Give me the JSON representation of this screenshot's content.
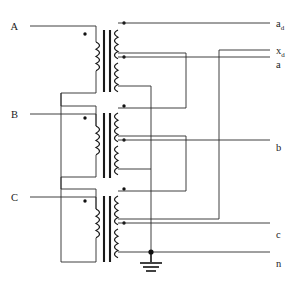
{
  "diagram": {
    "type": "electrical-schematic",
    "primary_connection": "delta",
    "secondary_connection": "zigzag-with-extended-delta-tap",
    "phase_count": 3,
    "core_limb_count": 3,
    "primary_winding_count": 3,
    "secondary_winding_count": 6
  },
  "terminals": {
    "primary": [
      {
        "id": "A",
        "label": "A",
        "x": 20,
        "y": 26
      },
      {
        "id": "B",
        "label": "B",
        "x": 20,
        "y": 114
      },
      {
        "id": "C",
        "label": "C",
        "x": 20,
        "y": 197
      }
    ],
    "secondary": [
      {
        "id": "ad",
        "label": "a",
        "sub": "d",
        "x": 276,
        "y": 24
      },
      {
        "id": "xd",
        "label": "x",
        "sub": "d",
        "x": 276,
        "y": 52
      },
      {
        "id": "a",
        "label": "a",
        "sub": "",
        "x": 276,
        "y": 65
      },
      {
        "id": "b",
        "label": "b",
        "sub": "",
        "x": 276,
        "y": 148
      },
      {
        "id": "c",
        "label": "c",
        "sub": "",
        "x": 276,
        "y": 235
      },
      {
        "id": "n",
        "label": "n",
        "sub": "",
        "x": 276,
        "y": 264
      }
    ]
  },
  "windings": {
    "primary": [
      {
        "id": "P-A",
        "phase": "A",
        "polarity_dot": true
      },
      {
        "id": "P-B",
        "phase": "B",
        "polarity_dot": true
      },
      {
        "id": "P-C",
        "phase": "C",
        "polarity_dot": true
      }
    ],
    "secondary": [
      {
        "id": "S1",
        "limb": 1,
        "position": "upper",
        "polarity_dot": true
      },
      {
        "id": "S2",
        "limb": 1,
        "position": "lower",
        "polarity_dot": true
      },
      {
        "id": "S3",
        "limb": 2,
        "position": "upper",
        "polarity_dot": true
      },
      {
        "id": "S4",
        "limb": 2,
        "position": "lower",
        "polarity_dot": true
      },
      {
        "id": "S5",
        "limb": 3,
        "position": "upper",
        "polarity_dot": true
      },
      {
        "id": "S6",
        "limb": 3,
        "position": "lower",
        "polarity_dot": true
      }
    ]
  },
  "ground": {
    "present": true,
    "symbol": "earth-ground",
    "x": 151,
    "y": 265,
    "junction_dot": true
  },
  "colors": {
    "background": "#ffffff",
    "wire": "#2b2b2b",
    "coil": "#1a1a1a",
    "core": "#1a1a1a",
    "dot": "#111111",
    "label": "#1a1a1a"
  }
}
